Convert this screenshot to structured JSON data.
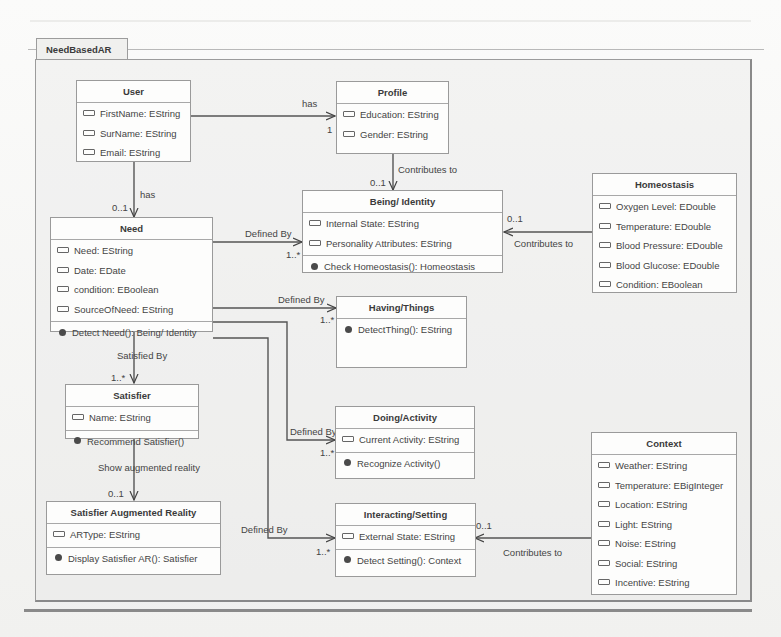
{
  "diagram": {
    "package_name": "NeedBasedAR",
    "classes": {
      "user": {
        "name": "User",
        "attributes": [
          "FirstName: EString",
          "SurName: EString",
          "Email: EString"
        ],
        "operations": []
      },
      "profile": {
        "name": "Profile",
        "attributes": [
          "Education: EString",
          "Gender: EString"
        ],
        "operations": []
      },
      "being_identity": {
        "name": "Being/ Identity",
        "attributes": [
          "Internal State: EString",
          "Personality Attributes: EString"
        ],
        "operations": [
          "Check Homeostasis(): Homeostasis"
        ]
      },
      "homeostasis": {
        "name": "Homeostasis",
        "attributes": [
          "Oxygen Level: EDouble",
          "Temperature: EDouble",
          "Blood Pressure: EDouble",
          "Blood Glucose: EDouble",
          "Condition: EBoolean"
        ],
        "operations": []
      },
      "need": {
        "name": "Need",
        "attributes": [
          "Need: EString",
          "Date: EDate",
          "condition: EBoolean",
          "SourceOfNeed: EString"
        ],
        "operations": [
          "Detect Need(): Being/ Identity"
        ]
      },
      "having_things": {
        "name": "Having/Things",
        "attributes": [],
        "operations": [
          "DetectThing(): EString"
        ]
      },
      "satisfier": {
        "name": "Satisfier",
        "attributes": [
          "Name: EString"
        ],
        "operations": [
          "Recommend Satisfier()"
        ]
      },
      "doing_activity": {
        "name": "Doing/Activity",
        "attributes": [
          "Current Activity: EString"
        ],
        "operations": [
          "Recognize Activity()"
        ]
      },
      "context": {
        "name": "Context",
        "attributes": [
          "Weather: EString",
          "Temperature: EBigInteger",
          "Location: EString",
          "Light: EString",
          "Noise: EString",
          "Social: EString",
          "Incentive: EString"
        ],
        "operations": []
      },
      "satisfier_ar": {
        "name": "Satisfier Augmented Reality",
        "attributes": [
          "ARType: EString"
        ],
        "operations": [
          "Display Satisfier AR(): Satisfier"
        ]
      },
      "interacting_setting": {
        "name": "Interacting/Setting",
        "attributes": [
          "External State: EString"
        ],
        "operations": [
          "Detect Setting(): Context"
        ]
      }
    },
    "associations": [
      {
        "from": "User",
        "to": "Profile",
        "label": "has",
        "multiplicity": "1"
      },
      {
        "from": "Profile",
        "to": "Being/ Identity",
        "label": "Contributes to",
        "multiplicity": "0..1"
      },
      {
        "from": "User",
        "to": "Need",
        "label": "has",
        "multiplicity": "0..1"
      },
      {
        "from": "Homeostasis",
        "to": "Being/ Identity",
        "label": "Contributes to",
        "multiplicity": "0..1"
      },
      {
        "from": "Need",
        "to": "Being/ Identity",
        "label": "Defined By",
        "multiplicity": "1..*"
      },
      {
        "from": "Need",
        "to": "Having/Things",
        "label": "Defined By",
        "multiplicity": "1..*"
      },
      {
        "from": "Need",
        "to": "Satisfier",
        "label": "Satisfied By",
        "multiplicity": "1..*"
      },
      {
        "from": "Need",
        "to": "Doing/Activity",
        "label": "Defined By",
        "multiplicity": "1..*"
      },
      {
        "from": "Satisfier",
        "to": "Satisfier Augmented Reality",
        "label": "Show augmented reality",
        "multiplicity": "0..1"
      },
      {
        "from": "Need",
        "to": "Interacting/Setting",
        "label": "Defined By",
        "multiplicity": "1..*"
      },
      {
        "from": "Context",
        "to": "Interacting/Setting",
        "label": "Contributes to",
        "multiplicity": "0..1"
      }
    ]
  }
}
